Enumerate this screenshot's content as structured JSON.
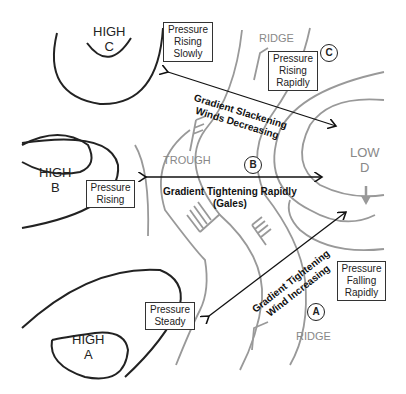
{
  "highs": [
    {
      "id": "C",
      "label": "HIGH",
      "letter": "C"
    },
    {
      "id": "B",
      "label": "HIGH",
      "letter": "B"
    },
    {
      "id": "A",
      "label": "HIGH",
      "letter": "A"
    }
  ],
  "low": {
    "label": "LOW",
    "letter": "D",
    "movement_icon": "arrow-down-icon"
  },
  "features": {
    "ridge_top": "RIDGE",
    "trough": "TROUGH",
    "ridge_bottom": "RIDGE"
  },
  "markers": {
    "a": "A",
    "b": "B",
    "c": "C"
  },
  "pressure_boxes": {
    "rising_slowly": [
      "Pressure",
      "Rising",
      "Slowly"
    ],
    "rising_rapidly": [
      "Pressure",
      "Rising",
      "Rapidly"
    ],
    "rising": [
      "Pressure",
      "Rising"
    ],
    "falling_rapidly": [
      "Pressure",
      "Falling",
      "Rapidly"
    ],
    "steady": [
      "Pressure",
      "Steady"
    ]
  },
  "gradients": {
    "slackening": [
      "Gradient Slackening",
      "Winds Decreasing"
    ],
    "tightening_rapidly": [
      "Gradient Tightening Rapidly",
      "(Gales)"
    ],
    "tightening": [
      "Gradient Tightening",
      "Wind Increasing"
    ]
  },
  "colors": {
    "isobar_high": "#222222",
    "isobar_low": "#999999",
    "text": "#111111",
    "feature_text": "#888888"
  }
}
